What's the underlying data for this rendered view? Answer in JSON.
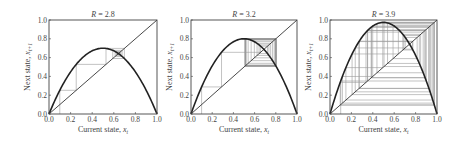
{
  "figure": {
    "panels_count": 3
  },
  "chart_data": [
    {
      "type": "line",
      "title": "R = 2.8",
      "title_var": "R",
      "title_value": "2.8",
      "xlabel": "Current state, x_t",
      "xlabel_text": "Current state, ",
      "xlabel_var": "x",
      "xlabel_sub": "t",
      "ylabel": "Next state, x_{t+1}",
      "ylabel_text": "Next state, ",
      "ylabel_var": "x",
      "ylabel_sub": "t+1",
      "xlim": [
        0.0,
        1.0
      ],
      "ylim": [
        0.0,
        1.0
      ],
      "xticks": [
        "0.0",
        "0.2",
        "0.4",
        "0.6",
        "0.8",
        "1.0"
      ],
      "yticks": [
        "0.0",
        "0.2",
        "0.4",
        "0.6",
        "0.8",
        "1.0"
      ],
      "grid": false,
      "legend": "none",
      "series": [
        {
          "name": "logistic map f(x)=R·x·(1−x)",
          "R": 2.8,
          "peak": 0.7
        },
        {
          "name": "identity line y=x"
        },
        {
          "name": "cobweb trajectory",
          "x0": 0.1,
          "iterations": 40,
          "converges_to": 0.643
        }
      ],
      "box": {
        "left": 49,
        "top": 20,
        "width": 108,
        "height": 94
      }
    },
    {
      "type": "line",
      "title": "R = 3.2",
      "title_var": "R",
      "title_value": "3.2",
      "xlabel": "Current state, x_t",
      "xlabel_text": "Current state, ",
      "xlabel_var": "x",
      "xlabel_sub": "t",
      "ylabel": "Next state, x_{t+1}",
      "ylabel_text": "Next state, ",
      "ylabel_var": "x",
      "ylabel_sub": "t+1",
      "xlim": [
        0.0,
        1.0
      ],
      "ylim": [
        0.0,
        1.0
      ],
      "xticks": [
        "0.0",
        "0.2",
        "0.4",
        "0.6",
        "0.8",
        "1.0"
      ],
      "yticks": [
        "0.0",
        "0.2",
        "0.4",
        "0.6",
        "0.8",
        "1.0"
      ],
      "grid": false,
      "legend": "none",
      "series": [
        {
          "name": "logistic map f(x)=R·x·(1−x)",
          "R": 3.2,
          "peak": 0.8
        },
        {
          "name": "identity line y=x"
        },
        {
          "name": "cobweb trajectory",
          "x0": 0.1,
          "iterations": 40,
          "cycle": [
            0.513,
            0.799
          ]
        }
      ],
      "box": {
        "left": 191,
        "top": 20,
        "width": 106,
        "height": 94
      }
    },
    {
      "type": "line",
      "title": "R = 3.9",
      "title_var": "R",
      "title_value": "3.9",
      "xlabel": "Current state, x_t",
      "xlabel_text": "Current state, ",
      "xlabel_var": "x",
      "xlabel_sub": "t",
      "ylabel": "Next state, x_{t+1}",
      "ylabel_text": "Next state, ",
      "ylabel_var": "x",
      "ylabel_sub": "t+1",
      "xlim": [
        0.0,
        1.0
      ],
      "ylim": [
        0.0,
        1.0
      ],
      "xticks": [
        "0.0",
        "0.2",
        "0.4",
        "0.6",
        "0.8",
        "1.0"
      ],
      "yticks": [
        "0.0",
        "0.2",
        "0.4",
        "0.6",
        "0.8",
        "1.0"
      ],
      "grid": false,
      "legend": "none",
      "series": [
        {
          "name": "logistic map f(x)=R·x·(1−x)",
          "R": 3.9,
          "peak": 0.975
        },
        {
          "name": "identity line y=x"
        },
        {
          "name": "cobweb trajectory",
          "x0": 0.1,
          "iterations": 40,
          "behavior": "chaotic"
        }
      ],
      "box": {
        "left": 330,
        "top": 20,
        "width": 107,
        "height": 94
      }
    }
  ],
  "colors": {
    "curve": "#222222",
    "identity": "#333333",
    "cobweb": "#9a9a9a",
    "axes": "#444444",
    "text": "#444444"
  }
}
